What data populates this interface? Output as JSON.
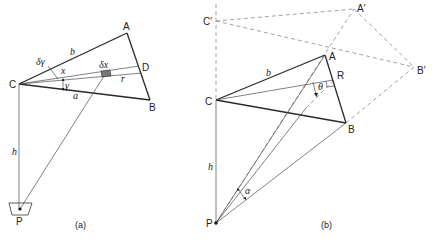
{
  "figure": {
    "panels": [
      {
        "id": "a",
        "caption": "(a)",
        "points": {
          "A": "A",
          "B": "B",
          "C": "C",
          "D": "D",
          "P": "P"
        },
        "labels": {
          "b": "b",
          "a": "a",
          "x": "x",
          "r": "r",
          "h": "h",
          "gamma": "γ",
          "delta_gamma": "δγ",
          "delta_x": "δx"
        }
      },
      {
        "id": "b",
        "caption": "(b)",
        "points": {
          "A": "A",
          "B": "B",
          "C": "C",
          "R": "R",
          "P": "P",
          "A_prime": "A′",
          "B_prime": "B′",
          "C_prime": "C′"
        },
        "labels": {
          "b": "b",
          "h": "h",
          "theta": "θ",
          "alpha": "α"
        }
      }
    ]
  }
}
